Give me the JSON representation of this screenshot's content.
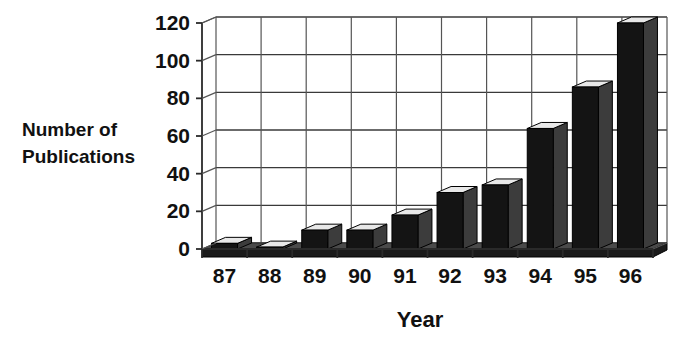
{
  "chart_data": {
    "type": "bar",
    "title": "",
    "subtitle": "",
    "xlabel": "Year",
    "ylabel": "Number of Publications",
    "ylabel_lines": [
      "Number of",
      "Publications"
    ],
    "categories": [
      "87",
      "88",
      "89",
      "90",
      "91",
      "92",
      "93",
      "94",
      "95",
      "96"
    ],
    "values": [
      3,
      1,
      10,
      10,
      18,
      30,
      34,
      64,
      86,
      120
    ],
    "ylim": [
      0,
      120
    ],
    "ytick_labels": [
      "0",
      "20",
      "40",
      "60",
      "80",
      "100",
      "120"
    ],
    "ytick_values": [
      0,
      20,
      40,
      60,
      80,
      100,
      120
    ],
    "grid": true,
    "grid_axis": "y",
    "legend": false,
    "legend_position": "none",
    "style": "3d-column",
    "colors": {
      "bar_front": "#141414",
      "bar_side": "#3c3c3c",
      "bar_top": "#e8e8e8",
      "grid": "#3a3a3a",
      "axis": "#2a2a2a",
      "text": "#111111",
      "background": "#ffffff"
    }
  },
  "geometry": {
    "plot_left": 202,
    "plot_right": 653,
    "plot_bottom": 249,
    "plot_top": 23,
    "depth_x": 14,
    "depth_y": -6,
    "bar_width": 26,
    "slot_width": 45.1
  }
}
